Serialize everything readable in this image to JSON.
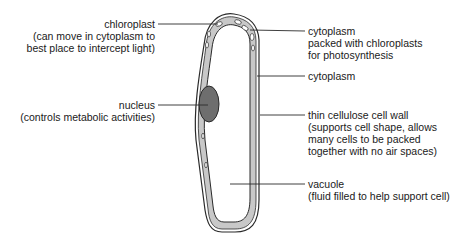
{
  "labels": {
    "chloroplast": {
      "name": "chloroplast",
      "desc": [
        "(can move in cytoplasm to",
        "best place to intercept light)"
      ]
    },
    "cytoplasm_chloroplasts": {
      "name": "cytoplasm",
      "desc": [
        "packed with chloroplasts",
        "for photosynthesis"
      ]
    },
    "cytoplasm": {
      "name": "cytoplasm"
    },
    "nucleus": {
      "name": "nucleus",
      "desc": [
        "(controls metabolic activities)"
      ]
    },
    "cell_wall": {
      "name": "thin cellulose cell wall",
      "desc": [
        "(supports cell shape, allows",
        "many cells to be packed",
        "together with no air spaces)"
      ]
    },
    "vacuole": {
      "name": "vacuole",
      "desc": [
        "(fluid filled to help support cell)"
      ]
    }
  },
  "colors": {
    "outline": "#2a2a2a",
    "cytoplasm_fill": "#c8c8c8",
    "nucleus_fill": "#6e6e6e",
    "background": "#ffffff"
  }
}
